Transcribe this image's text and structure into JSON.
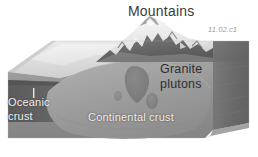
{
  "figure": {
    "title": "Mountains",
    "figure_id": "11.02.c1",
    "labels": {
      "granite_line1": "Granite",
      "granite_line2": "plutons",
      "oceanic_line1": "Oceanic",
      "oceanic_line2": "crust",
      "continental": "Continental crust"
    },
    "colors": {
      "background": "#ffffff",
      "ocean_surface_light": "#e6e6e6",
      "ocean_surface_mid": "#d5d5d5",
      "block_front_face": "#8f8f8f",
      "block_right_face": "#6e6e6e",
      "continental_crust": "#9a9a9a",
      "oceanic_crust_band": "#5c5c5c",
      "pluton": "#7b7b7b",
      "mountain_snow": "#f4f4f4",
      "mountain_rock": "#3d3d3d",
      "title_text": "#3a3a3a",
      "white_label_text": "#f2f2f2",
      "figure_id_text": "#9a9a9a"
    },
    "icon_names": [
      "mountain-range-icon",
      "granite-pluton-icon",
      "oceanic-crust-band-icon",
      "tick-mark-icon"
    ]
  }
}
